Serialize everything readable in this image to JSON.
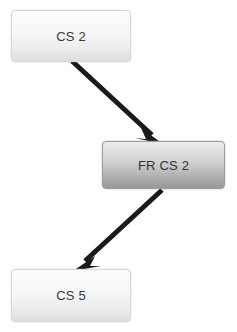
{
  "diagram": {
    "type": "flowchart",
    "background_color": "#ffffff",
    "nodes": [
      {
        "id": "cs2",
        "label": "CS 2",
        "style": "light",
        "fill_top_color": "#fdfdfd",
        "fill_bottom_color": "#dedede",
        "border_color": "#d8d8d8",
        "text_color": "#3a3a3a"
      },
      {
        "id": "frcs2",
        "label": "FR CS 2",
        "style": "dark",
        "fill_top_color": "#ececec",
        "fill_bottom_color": "#979797",
        "border_color": "#9d9d9d",
        "text_color": "#333333"
      },
      {
        "id": "cs5",
        "label": "CS 5",
        "style": "light",
        "fill_top_color": "#fdfdfd",
        "fill_bottom_color": "#dedede",
        "border_color": "#d8d8d8",
        "text_color": "#3a3a3a"
      }
    ],
    "edges": [
      {
        "id": "edge-cs2-to-frcs2",
        "from": "cs2",
        "to": "frcs2",
        "direction": "down-right",
        "color": "#1a1a1a",
        "arrowhead": "solid-triangle"
      },
      {
        "id": "edge-frcs2-to-cs5",
        "from": "frcs2",
        "to": "cs5",
        "direction": "down-left",
        "color": "#1a1a1a",
        "arrowhead": "solid-triangle"
      }
    ]
  }
}
